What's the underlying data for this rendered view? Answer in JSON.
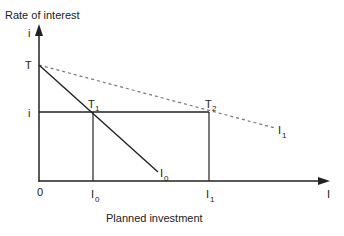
{
  "diagram": {
    "y_axis_title": "Rate of interest",
    "y_axis_symbol": "i",
    "x_axis_title": "Planned investment",
    "x_axis_symbol": "I",
    "origin": "0",
    "labels": {
      "T": "T",
      "T1": "T",
      "T1_sub": "1",
      "T2": "T",
      "T2_sub": "2",
      "i": "i",
      "I0_curve": "I",
      "I0_curve_sub": "0",
      "I1_curve": "I",
      "I1_curve_sub": "1",
      "I0_tick": "I",
      "I0_tick_sub": "0",
      "I1_tick": "I",
      "I1_tick_sub": "1"
    },
    "colors": {
      "line": "#222222",
      "dashed": "#777777"
    }
  }
}
